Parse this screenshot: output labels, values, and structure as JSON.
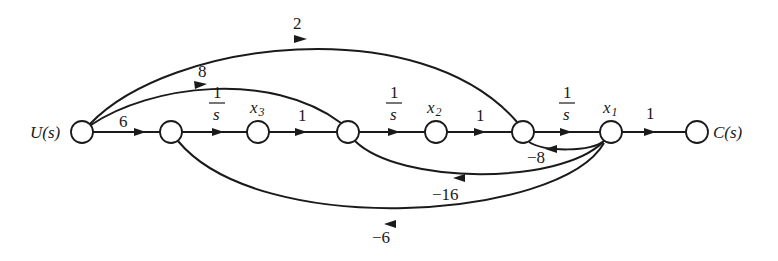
{
  "diagram": {
    "type": "signal-flow-graph",
    "nodes": [
      {
        "id": "U",
        "label": "U(s)",
        "x": 82,
        "y": 132
      },
      {
        "id": "n2",
        "label": "",
        "x": 171,
        "y": 132
      },
      {
        "id": "x3",
        "label": "x",
        "sub": "3",
        "x": 258,
        "y": 132
      },
      {
        "id": "n4",
        "label": "",
        "x": 348,
        "y": 132
      },
      {
        "id": "x2",
        "label": "x",
        "sub": "2",
        "x": 436,
        "y": 132
      },
      {
        "id": "n6",
        "label": "",
        "x": 523,
        "y": 132
      },
      {
        "id": "x1",
        "label": "x",
        "sub": "1",
        "x": 611,
        "y": 132
      },
      {
        "id": "C",
        "label": "C(s)",
        "x": 697,
        "y": 132
      }
    ],
    "edges": [
      {
        "from": "U",
        "to": "n2",
        "gain": "6"
      },
      {
        "from": "n2",
        "to": "x3",
        "gain_num": "1",
        "gain_den": "s"
      },
      {
        "from": "x3",
        "to": "n4",
        "gain": "1"
      },
      {
        "from": "n4",
        "to": "x2",
        "gain_num": "1",
        "gain_den": "s"
      },
      {
        "from": "x2",
        "to": "n6",
        "gain": "1"
      },
      {
        "from": "n6",
        "to": "x1",
        "gain_num": "1",
        "gain_den": "s"
      },
      {
        "from": "x1",
        "to": "C",
        "gain": "1"
      },
      {
        "from": "U",
        "to": "n6",
        "gain": "2"
      },
      {
        "from": "U",
        "to": "n4",
        "gain": "8"
      },
      {
        "from": "x1",
        "to": "n6",
        "gain": "−8"
      },
      {
        "from": "x1",
        "to": "n4",
        "gain": "−16"
      },
      {
        "from": "x1",
        "to": "n2",
        "gain": "−6"
      }
    ]
  },
  "labels": {
    "input": "U(s)",
    "output": "C(s)",
    "x_var": "x",
    "x3_sub": "3",
    "x2_sub": "2",
    "x1_sub": "1",
    "gain_6": "6",
    "gain_2": "2",
    "gain_8": "8",
    "one": "1",
    "s": "s",
    "gain_x3_n4": "1",
    "gain_x2_n6": "1",
    "gain_x1_C": "1",
    "gain_m8": "−8",
    "gain_m16": "−16",
    "gain_m6": "−6"
  }
}
